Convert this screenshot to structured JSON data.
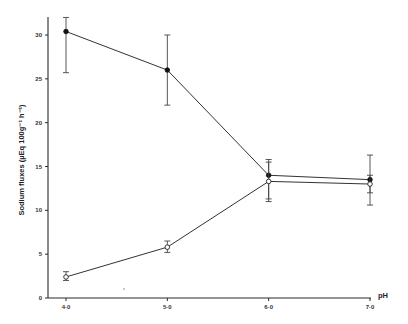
{
  "chart_data": {
    "type": "line",
    "title": "",
    "xlabel": "pH",
    "ylabel": "Sodium fluxes  (µEq  100g⁻¹  h⁻¹)",
    "xlim": [
      3.82,
      7.0
    ],
    "ylim": [
      0,
      32
    ],
    "x_ticks": [
      {
        "value": 4.0,
        "label": "4·0"
      },
      {
        "value": 5.0,
        "label": "5·0"
      },
      {
        "value": 6.0,
        "label": "6·0"
      },
      {
        "value": 7.0,
        "label": "7·0"
      }
    ],
    "y_ticks": [
      {
        "value": 0,
        "label": "0"
      },
      {
        "value": 5,
        "label": "5"
      },
      {
        "value": 10,
        "label": "10"
      },
      {
        "value": 15,
        "label": "15"
      },
      {
        "value": 20,
        "label": "20"
      },
      {
        "value": 25,
        "label": "25"
      },
      {
        "value": 30,
        "label": "30"
      }
    ],
    "grid": false,
    "legend": "none",
    "series": [
      {
        "name": "filled",
        "marker": "filled-circle",
        "x": [
          4.0,
          5.0,
          6.0,
          7.0
        ],
        "y": [
          30.4,
          26.0,
          14.0,
          13.5
        ],
        "err_low": [
          25.7,
          22.0,
          11.3,
          12.0
        ],
        "err_high": [
          32.0,
          30.0,
          15.8,
          16.3
        ]
      },
      {
        "name": "open",
        "marker": "open-circle",
        "x": [
          4.0,
          5.0,
          6.0,
          7.0
        ],
        "y": [
          2.4,
          5.8,
          13.3,
          13.0
        ],
        "err_low": [
          2.0,
          5.2,
          11.0,
          10.6
        ],
        "err_high": [
          3.0,
          6.5,
          15.5,
          14.0
        ]
      }
    ]
  }
}
